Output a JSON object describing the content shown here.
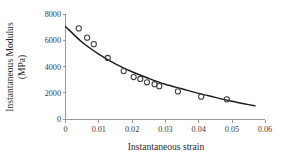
{
  "chart_data": {
    "type": "scatter",
    "title": "",
    "xlabel": "Instantaneous strain",
    "ylabel_line1": "Instantaneous Modulus",
    "ylabel_line2": "(MPa)",
    "ylabel": "Instantaneous Modulus (MPa)",
    "xlim": [
      0,
      0.06
    ],
    "ylim": [
      0,
      8000
    ],
    "grid": false,
    "legend": "none",
    "xticks": [
      0,
      0.01,
      0.02,
      0.03,
      0.04,
      0.05,
      0.06
    ],
    "xticklabels": [
      "0",
      "0.01",
      "0.02",
      "0.03",
      "0.04",
      "0.05",
      "0.06"
    ],
    "yticks": [
      0,
      2000,
      4000,
      6000,
      8000
    ],
    "yticklabels": [
      "0",
      "2000",
      "4000",
      "6000",
      "8000"
    ],
    "series": [
      {
        "name": "Measured data",
        "marker": "open-circle",
        "x": [
          0.004,
          0.0065,
          0.0085,
          0.0127,
          0.0175,
          0.0205,
          0.0225,
          0.0245,
          0.0268,
          0.0282,
          0.0338,
          0.0408,
          0.0485
        ],
        "y": [
          6900,
          6200,
          5700,
          4650,
          3650,
          3200,
          3050,
          2800,
          2650,
          2500,
          2100,
          1700,
          1500
        ]
      },
      {
        "name": "Fitted decay curve",
        "marker": "none",
        "line": "solid",
        "x": [
          0.0,
          0.005,
          0.01,
          0.015,
          0.02,
          0.025,
          0.03,
          0.035,
          0.04,
          0.045,
          0.05,
          0.057
        ],
        "y": [
          7050,
          5850,
          4950,
          4200,
          3600,
          3100,
          2650,
          2300,
          1950,
          1650,
          1350,
          1000
        ]
      }
    ]
  },
  "axes": {
    "x_title": "Instantaneous strain",
    "y_title_line1": "Instantaneous Modulus",
    "y_title_line2": "(MPa)"
  },
  "colors": {
    "axis": "#9a9a9a",
    "curve": "#1c1c1c",
    "marker": "#3c3c3c",
    "text": "#2b2b2b",
    "background": "#ffffff"
  }
}
